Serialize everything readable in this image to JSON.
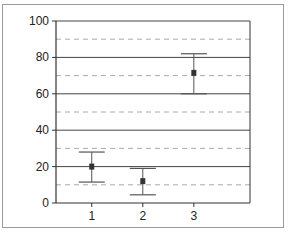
{
  "chart_data": {
    "type": "scatter",
    "subtype": "error-bar",
    "title": "",
    "xlabel": "",
    "ylabel": "",
    "categories": [
      "1",
      "2",
      "3"
    ],
    "x": [
      1,
      2,
      3
    ],
    "values": [
      20,
      12,
      71.5
    ],
    "error_upper": [
      28,
      19,
      82
    ],
    "error_lower": [
      11.5,
      4.5,
      60
    ],
    "ylim": [
      0,
      100
    ],
    "xlim": [
      0.3,
      4.1
    ],
    "y_ticks": [
      0,
      20,
      40,
      60,
      80,
      100
    ],
    "y_tick_labels": [
      "0",
      "20",
      "40",
      "60",
      "80",
      "100"
    ],
    "x_ticks": [
      1,
      2,
      3
    ],
    "x_tick_labels": [
      "1",
      "2",
      "3"
    ],
    "grid": {
      "major": [
        20,
        40,
        60,
        80,
        100
      ],
      "major_style": "solid",
      "minor": [
        10,
        30,
        50,
        70,
        90
      ],
      "minor_style": "dashed"
    },
    "legend": null,
    "colors": {
      "major_grid": "#444444",
      "minor_grid": "#aaaaaa",
      "error_bar": "#555555",
      "point": "#333333",
      "axis": "#333333"
    }
  }
}
